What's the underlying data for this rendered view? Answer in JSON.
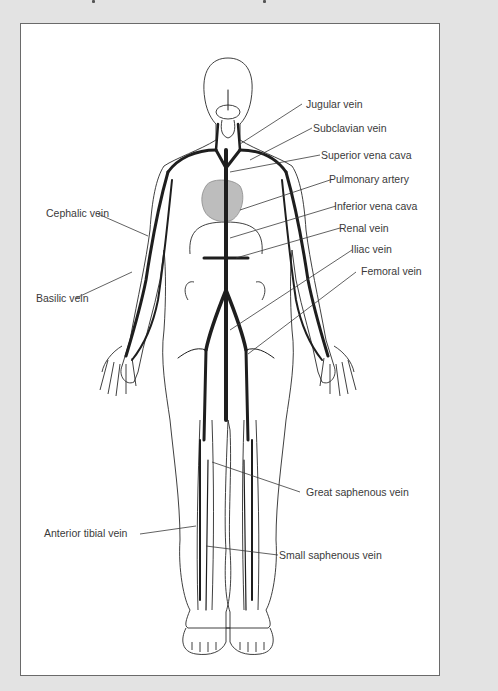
{
  "figure": {
    "background_color": "#e3e3e3",
    "panel_color": "#ffffff",
    "border_color": "#6a6a6a",
    "vein_color": "#1e1e1e",
    "heart_color": "#bdbdbd"
  },
  "labels": {
    "right": [
      {
        "id": "jugular",
        "text": "Jugular vein"
      },
      {
        "id": "subclavian",
        "text": "Subclavian vein"
      },
      {
        "id": "superior_vena_cava",
        "text": "Superior vena cava"
      },
      {
        "id": "pulmonary_artery",
        "text": "Pulmonary artery"
      },
      {
        "id": "inferior_vena_cava",
        "text": "Inferior vena cava"
      },
      {
        "id": "renal",
        "text": "Renal vein"
      },
      {
        "id": "iliac",
        "text": "Iliac vein"
      },
      {
        "id": "femoral",
        "text": "Femoral vein"
      },
      {
        "id": "great_saphenous",
        "text": "Great saphenous vein"
      },
      {
        "id": "small_saphenous",
        "text": "Small saphenous vein"
      }
    ],
    "left": [
      {
        "id": "cephalic",
        "text": "Cephalic vein"
      },
      {
        "id": "basilic",
        "text": "Basilic vein"
      },
      {
        "id": "anterior_tibial",
        "text": "Anterior tibial vein"
      }
    ]
  }
}
